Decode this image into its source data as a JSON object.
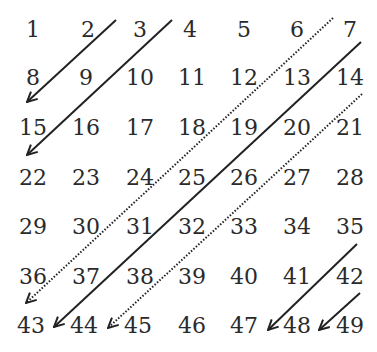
{
  "diagram": {
    "title": "",
    "grid": {
      "rows": 7,
      "cols": 7,
      "values": [
        [
          "1",
          "2",
          "3",
          "4",
          "5",
          "6",
          "7"
        ],
        [
          "8",
          "9",
          "10",
          "11",
          "12",
          "13",
          "14"
        ],
        [
          "15",
          "16",
          "17",
          "18",
          "19",
          "20",
          "21"
        ],
        [
          "22",
          "23",
          "24",
          "25",
          "26",
          "27",
          "28"
        ],
        [
          "29",
          "30",
          "31",
          "32",
          "33",
          "34",
          "35"
        ],
        [
          "36",
          "37",
          "38",
          "39",
          "40",
          "41",
          "42"
        ],
        [
          "43",
          "44",
          "45",
          "46",
          "47",
          "48",
          "49"
        ]
      ]
    },
    "arrows": [
      {
        "style": "solid",
        "from_near": "2",
        "to_near": "8",
        "through": [
          "2",
          "8"
        ]
      },
      {
        "style": "solid",
        "from_near": "3",
        "to_near": "15",
        "through": [
          "3",
          "9",
          "15"
        ]
      },
      {
        "style": "dotted",
        "from_near": "6",
        "to_near": "36",
        "through": [
          "6",
          "12",
          "18",
          "24",
          "30",
          "36"
        ]
      },
      {
        "style": "solid",
        "from_near": "7",
        "to_near": "43",
        "through": [
          "7",
          "13",
          "19",
          "25",
          "31",
          "37",
          "43"
        ]
      },
      {
        "style": "dotted",
        "from_near": "14",
        "to_near": "44",
        "through": [
          "14",
          "20",
          "26",
          "32",
          "38",
          "44"
        ]
      },
      {
        "style": "solid",
        "from_near": "35",
        "to_near": "47",
        "through": [
          "35",
          "41",
          "47"
        ]
      },
      {
        "style": "solid",
        "from_near": "42",
        "to_near": "48",
        "through": [
          "42",
          "48"
        ]
      }
    ],
    "colors": {
      "text": "#2a2a2a",
      "line": "#222222",
      "background": "#ffffff"
    }
  }
}
